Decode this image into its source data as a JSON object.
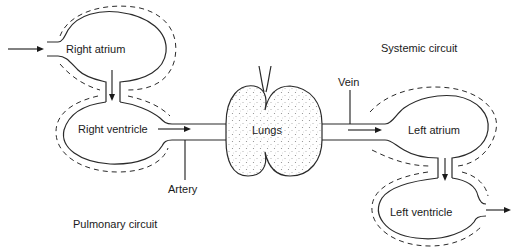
{
  "diagram": {
    "type": "circulation-schematic",
    "labels": {
      "right_atrium": "Right atrium",
      "right_ventricle": "Right ventricle",
      "lungs": "Lungs",
      "left_atrium": "Left atrium",
      "left_ventricle": "Left ventricle",
      "artery": "Artery",
      "vein": "Vein",
      "systemic_circuit": "Systemic circuit",
      "pulmonary_circuit": "Pulmonary circuit"
    },
    "flow": [
      "Right atrium",
      "Right ventricle",
      "Artery",
      "Lungs",
      "Vein",
      "Left atrium",
      "Left ventricle"
    ],
    "colors": {
      "line": "#2a2a2a",
      "lung_stipple": "#9a9a9a",
      "background": "#ffffff"
    }
  }
}
